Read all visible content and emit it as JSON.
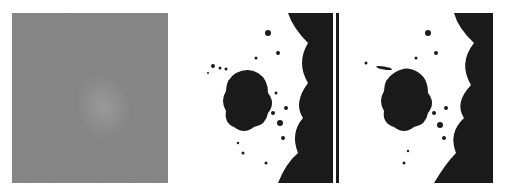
{
  "figure": {
    "panels": [
      {
        "id": "original",
        "kind": "grayscale-image",
        "caption": ""
      },
      {
        "id": "segmentation-1",
        "kind": "binary-mask",
        "caption": ""
      },
      {
        "id": "segmentation-2",
        "kind": "binary-mask",
        "caption": ""
      }
    ],
    "colors": {
      "background": "#ffffff",
      "gray": "#8a8a8a",
      "lesion": "#1a1a1a",
      "mask_bg": "#ffffff"
    }
  }
}
